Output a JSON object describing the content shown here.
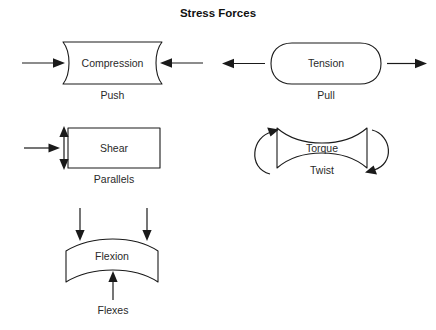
{
  "title": "Stress Forces",
  "colors": {
    "background": "#ffffff",
    "stroke": "#1a1a1a",
    "text": "#2a2a2a",
    "title_text": "#111111"
  },
  "items": [
    {
      "id": "compression",
      "shape": "concave-sided-block",
      "label": "Compression",
      "caption": "Push",
      "arrows": "two horizontal arrows pointing inward toward the shape"
    },
    {
      "id": "tension",
      "shape": "stadium-rounded-block",
      "label": "Tension",
      "caption": "Pull",
      "arrows": "two horizontal arrows pointing outward away from the shape"
    },
    {
      "id": "shear",
      "shape": "rectangle",
      "label": "Shear",
      "caption": "Parallels",
      "arrows": "horizontal arrow pointing right plus vertical double-headed arrow"
    },
    {
      "id": "torque",
      "shape": "hourglass",
      "label": "Torque",
      "caption": "Twist",
      "arrows": "two curved rotation arrows wrapping the left and right sides"
    },
    {
      "id": "flexion",
      "shape": "curved-arch-band",
      "label": "Flexion",
      "caption": "Flexes",
      "arrows": "two arrows pointing down from above and one arrow pointing up from below"
    }
  ]
}
